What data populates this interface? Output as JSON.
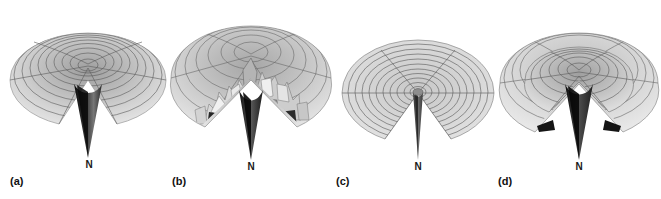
{
  "figure": {
    "background_color": "#ffffff",
    "surface_color": "#c9c9c9",
    "mesh_color": "#4a4a4a",
    "spike_color": "#141414",
    "rugged_light": "#ededed",
    "rugged_dark": "#2b2b2b"
  },
  "panels": [
    {
      "id": "a",
      "label": "(a)",
      "apex_label": "N",
      "surface_type": "smooth-funnel",
      "ring_count": 9,
      "radial_count": 5,
      "cx": 88,
      "cy": 80,
      "rx": 78,
      "ry": 47,
      "apex_x": 88,
      "apex_y": 158,
      "wedge_half_angle_deg": 21
    },
    {
      "id": "b",
      "label": "(b)",
      "apex_label": "N",
      "surface_type": "rugged-funnel",
      "ring_count": 6,
      "radial_count": 5,
      "cx": 251,
      "cy": 78,
      "rx": 80,
      "ry": 52,
      "apex_x": 249,
      "apex_y": 160,
      "wedge_half_angle_deg": 22
    },
    {
      "id": "c",
      "label": "(c)",
      "apex_label": "N",
      "surface_type": "flat-disc-golf-course",
      "ring_count": 11,
      "radial_count": 5,
      "cx": 418,
      "cy": 93,
      "rx": 76,
      "ry": 53,
      "apex_x": 418,
      "apex_y": 160,
      "wedge_half_angle_deg": 23
    },
    {
      "id": "d",
      "label": "(d)",
      "apex_label": "N",
      "surface_type": "moat-funnel",
      "ring_count": 8,
      "radial_count": 5,
      "cx": 579,
      "cy": 83,
      "rx": 80,
      "ry": 50,
      "apex_x": 577,
      "apex_y": 160,
      "wedge_half_angle_deg": 21
    }
  ],
  "labels": {
    "a_pos": {
      "x": 10,
      "y": 176
    },
    "b_pos": {
      "x": 172,
      "y": 176
    },
    "c_pos": {
      "x": 336,
      "y": 176
    },
    "d_pos": {
      "x": 498,
      "y": 176
    },
    "apex_a": {
      "x": 79,
      "y": 162
    },
    "apex_b": {
      "x": 240,
      "y": 164
    },
    "apex_c": {
      "x": 409,
      "y": 164
    },
    "apex_d": {
      "x": 568,
      "y": 164
    }
  }
}
